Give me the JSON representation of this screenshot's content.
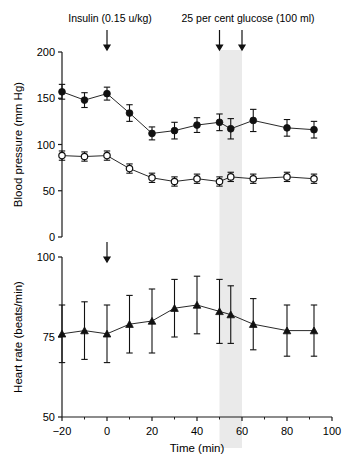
{
  "figure": {
    "annotations": [
      {
        "id": "insulin",
        "label": "Insulin (0.15 u/kg)",
        "time_min": 0
      },
      {
        "id": "glucose",
        "label": "25 per cent glucose (100 ml)",
        "time_min": 55
      }
    ],
    "shaded_band": {
      "label": "",
      "start_min": 50,
      "end_min": 60,
      "color": "#d9d9d9"
    },
    "arrows_time_min": [
      0,
      50,
      60
    ],
    "lower_arrow_time_min": 0
  },
  "chart_data": [
    {
      "type": "line",
      "id": "blood-pressure-panel",
      "title": "",
      "xlabel": "Time (min)",
      "ylabel": "Blood pressure (mm Hg)",
      "xlim": [
        -20,
        100
      ],
      "ylim": [
        0,
        200
      ],
      "xticks": [
        -20,
        0,
        20,
        40,
        60,
        80,
        100
      ],
      "xtick_labels": [
        "−20",
        "0",
        "20",
        "40",
        "60",
        "80",
        "100"
      ],
      "xminor_ticks": [
        -10,
        10,
        30,
        50,
        70,
        90
      ],
      "yticks": [
        0,
        50,
        100,
        150,
        200
      ],
      "ytick_labels": [
        "0",
        "50",
        "100",
        "150",
        "200"
      ],
      "grid": false,
      "legend": "none",
      "x": [
        -20,
        -10,
        0,
        10,
        20,
        30,
        40,
        50,
        55,
        65,
        80,
        92
      ],
      "series": [
        {
          "name": "Systolic blood pressure",
          "marker": "filled-circle",
          "values": [
            157,
            148,
            155,
            134,
            112,
            115,
            121,
            124,
            117,
            126,
            118,
            116
          ],
          "errors": [
            8,
            8,
            7,
            9,
            7,
            9,
            8,
            9,
            11,
            12,
            9,
            9
          ]
        },
        {
          "name": "Diastolic blood pressure",
          "marker": "open-circle",
          "values": [
            88,
            87,
            88,
            74,
            64,
            60,
            63,
            60,
            65,
            63,
            65,
            63
          ],
          "errors": [
            5,
            5,
            5,
            5,
            5,
            5,
            5,
            5,
            5,
            5,
            5,
            5
          ]
        }
      ]
    },
    {
      "type": "line",
      "id": "heart-rate-panel",
      "title": "",
      "xlabel": "Time (min)",
      "ylabel": "Heart rate (beats/min)",
      "xlim": [
        -20,
        100
      ],
      "ylim": [
        50,
        100
      ],
      "xticks": [
        -20,
        0,
        20,
        40,
        60,
        80,
        100
      ],
      "xtick_labels": [
        "−20",
        "0",
        "20",
        "40",
        "60",
        "80",
        "100"
      ],
      "xminor_ticks": [
        -10,
        10,
        30,
        50,
        70,
        90
      ],
      "yticks": [
        50,
        75,
        100
      ],
      "ytick_labels": [
        "50",
        "75",
        "100"
      ],
      "grid": false,
      "legend": "none",
      "x": [
        -20,
        -10,
        0,
        10,
        20,
        30,
        40,
        50,
        55,
        65,
        80,
        92
      ],
      "series": [
        {
          "name": "Heart rate",
          "marker": "filled-triangle",
          "values": [
            76,
            77,
            76,
            79,
            80,
            84,
            85,
            83,
            82,
            79,
            77,
            77
          ],
          "errors": [
            9,
            9,
            9,
            9,
            10,
            9,
            9,
            10,
            9,
            8,
            8,
            8
          ]
        }
      ]
    }
  ]
}
